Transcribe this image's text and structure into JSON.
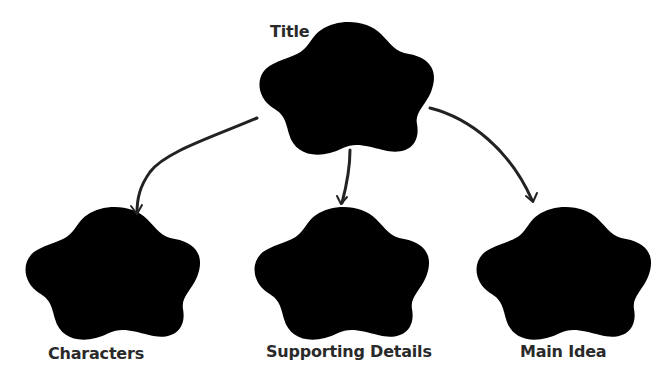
{
  "diagram": {
    "type": "graphic-organizer",
    "nodes": [
      {
        "id": "title",
        "label": "Title"
      },
      {
        "id": "characters",
        "label": "Characters"
      },
      {
        "id": "supporting_details",
        "label": "Supporting Details"
      },
      {
        "id": "main_idea",
        "label": "Main Idea"
      }
    ],
    "edges": [
      {
        "from": "title",
        "to": "characters"
      },
      {
        "from": "title",
        "to": "supporting_details"
      },
      {
        "from": "title",
        "to": "main_idea"
      }
    ]
  },
  "labels": {
    "title": "Title",
    "characters": "Characters",
    "supporting_details": "Supporting Details",
    "main_idea": "Main Idea"
  },
  "colors": {
    "outline": "#8a8a8a",
    "arrow": "#222222",
    "text": "#2a2a2a",
    "background": "#ffffff"
  }
}
